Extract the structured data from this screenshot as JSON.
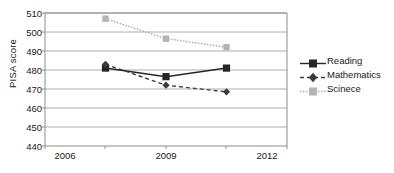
{
  "chart_data": {
    "type": "line",
    "title": "",
    "xlabel": "",
    "ylabel": "PISA score",
    "categories": [
      "2006",
      "2009",
      "2012"
    ],
    "ylim": [
      440,
      510
    ],
    "yticks": [
      440,
      450,
      460,
      470,
      480,
      490,
      500,
      510
    ],
    "ytick_labels": [
      "440",
      "450",
      "460",
      "470",
      "480",
      "490",
      "500",
      "510"
    ],
    "grid": "horizontal",
    "legend_position": "right",
    "series": [
      {
        "name": "Reading",
        "values": [
          481,
          476.5,
          481
        ],
        "marker": "square",
        "line_style": "solid",
        "color": "#262626"
      },
      {
        "name": "Mathematics",
        "values": [
          483,
          472,
          468.5
        ],
        "marker": "diamond",
        "line_style": "dashed",
        "color": "#3b3b3b"
      },
      {
        "name": "Scinece",
        "values": [
          507,
          496.5,
          492
        ],
        "marker": "square",
        "line_style": "dotted",
        "color": "#a6a6a6"
      }
    ]
  },
  "axes": {
    "y_title": "PISA score",
    "x_tick_labels": [
      "2006",
      "2009",
      "2012"
    ],
    "y_tick_labels": [
      "510",
      "500",
      "490",
      "480",
      "470",
      "460",
      "450",
      "440"
    ]
  },
  "legend": {
    "items": [
      {
        "label": "Reading"
      },
      {
        "label": "Mathematics"
      },
      {
        "label": "Scinece"
      }
    ]
  },
  "colors": {
    "reading": "#262626",
    "mathematics": "#3b3b3b",
    "science": "#a6a6a6",
    "grid": "#9a9a9a",
    "axis": "#8c8c8c",
    "text": "#1a1a1a"
  }
}
